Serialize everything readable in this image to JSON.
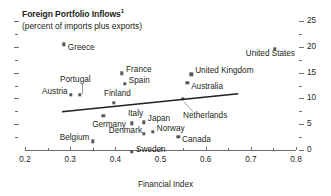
{
  "chart_data": {
    "type": "scatter",
    "title": "Foreign Portfolio Inflows",
    "title_footnote_marker": "1",
    "subtitle": "(percent of imports plus exports)",
    "xlabel": "Financial Index",
    "ylabel": "",
    "xlim": [
      0.2,
      0.8
    ],
    "ylim": [
      0,
      25
    ],
    "xticks": [
      "0.2",
      "0.3",
      "0.4",
      "0.5",
      "0.6",
      "0.7",
      "0.8"
    ],
    "xtick_values": [
      0.2,
      0.3,
      0.4,
      0.5,
      0.6,
      0.7,
      0.8
    ],
    "yticks": [
      "0",
      "5",
      "10",
      "15",
      "20",
      "25"
    ],
    "ytick_values": [
      0,
      5,
      10,
      15,
      20,
      25
    ],
    "y_minor_values": [
      2.5,
      7.5,
      12.5,
      17.5,
      22.5
    ],
    "grid": false,
    "legend": "none",
    "y_axis_position": "right",
    "marker_color": "#58595b",
    "axis_color": "#6d6e71",
    "text_color": "#231f20",
    "trendline": {
      "show": true,
      "color": "#231f20",
      "x_start": 0.282,
      "y_start": 7.4,
      "x_end": 0.672,
      "y_end": 10.9
    },
    "points": [
      {
        "label": "Greece",
        "x": 0.286,
        "y": 20.5,
        "label_dx": 4,
        "label_dy": 4,
        "leader": false
      },
      {
        "label": "United States",
        "x": 0.753,
        "y": 19.6,
        "label_dx": -29,
        "label_dy": 5,
        "leader": false
      },
      {
        "label": "France",
        "x": 0.415,
        "y": 14.9,
        "label_dx": 4,
        "label_dy": -3,
        "leader": false
      },
      {
        "label": "United Kingdom",
        "x": 0.568,
        "y": 14.7,
        "label_dx": 4,
        "label_dy": -3,
        "leader": false
      },
      {
        "label": "Spain",
        "x": 0.421,
        "y": 12.8,
        "label_dx": 4,
        "label_dy": -3,
        "leader": false
      },
      {
        "label": "Australia",
        "x": 0.559,
        "y": 13.0,
        "label_dx": 4,
        "label_dy": 4,
        "leader": false
      },
      {
        "label": "Austria",
        "x": 0.302,
        "y": 10.7,
        "label_dx": -29,
        "label_dy": -3,
        "leader": false
      },
      {
        "label": "Portugal",
        "x": 0.322,
        "y": 10.7,
        "label_dx": -20,
        "label_dy": -15,
        "leader": true
      },
      {
        "label": "Netherlands",
        "x": 0.55,
        "y": 9.9,
        "label_dx": 0,
        "label_dy": 17,
        "leader": true
      },
      {
        "label": "Finland",
        "x": 0.397,
        "y": 9.1,
        "label_dx": -10,
        "label_dy": -9,
        "leader": false
      },
      {
        "label": "Germany",
        "x": 0.373,
        "y": 6.6,
        "label_dx": -11,
        "label_dy": 9,
        "leader": false
      },
      {
        "label": "Japan",
        "x": 0.463,
        "y": 5.4,
        "label_dx": 4,
        "label_dy": -3,
        "leader": false
      },
      {
        "label": "Italy",
        "x": 0.437,
        "y": 5.2,
        "label_dx": -4,
        "label_dy": -9,
        "leader": false
      },
      {
        "label": "Norway",
        "x": 0.483,
        "y": 3.5,
        "label_dx": 4,
        "label_dy": -3,
        "leader": false
      },
      {
        "label": "Denmark",
        "x": 0.463,
        "y": 3.1,
        "label_dx": -35,
        "label_dy": -3,
        "leader": false
      },
      {
        "label": "Canada",
        "x": 0.539,
        "y": 2.5,
        "label_dx": 4,
        "label_dy": 3,
        "leader": false
      },
      {
        "label": "Belgium",
        "x": 0.35,
        "y": 1.7,
        "label_dx": -33,
        "label_dy": -3,
        "leader": false
      },
      {
        "label": "Sweden",
        "x": 0.437,
        "y": -0.3,
        "label_dx": 4,
        "label_dy": -2,
        "leader": false
      }
    ]
  }
}
